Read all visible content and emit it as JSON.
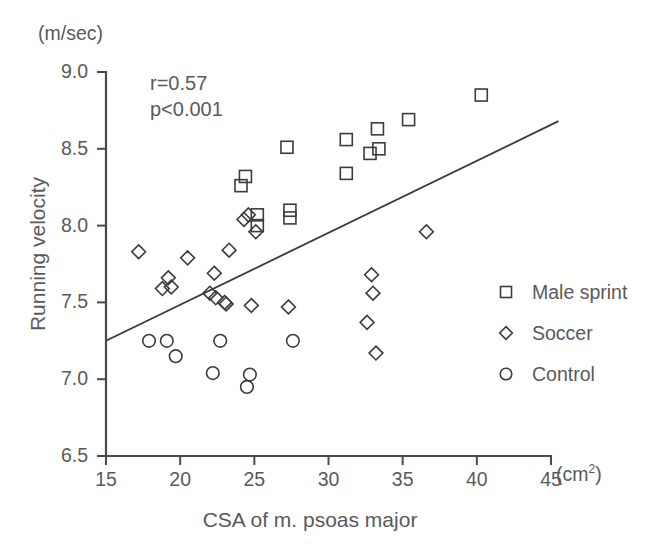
{
  "chart_data": {
    "type": "scatter",
    "title": "",
    "xlabel": "CSA of m. psoas major",
    "ylabel": "Running velocity",
    "x_unit": "(cm",
    "x_unit_sup": "2",
    "x_unit_close": ")",
    "y_unit": "(m/sec)",
    "xlim": [
      15,
      45
    ],
    "ylim": [
      6.5,
      9.0
    ],
    "xticks": [
      15,
      20,
      25,
      30,
      35,
      40,
      45
    ],
    "xtick_labels": [
      "15",
      "20",
      "25",
      "30",
      "35",
      "40",
      "45"
    ],
    "yticks": [
      6.5,
      7.0,
      7.5,
      8.0,
      8.5,
      9.0
    ],
    "ytick_labels": [
      "6.5",
      "7.0",
      "7.5",
      "8.0",
      "8.5",
      "9.0"
    ],
    "grid": false,
    "legend_position": "right-middle",
    "annotations": [
      {
        "name": "correlation",
        "text": "r=0.57"
      },
      {
        "name": "p-value",
        "text": "p<0.001"
      }
    ],
    "regression_line": {
      "x": [
        15.0,
        45.5
      ],
      "y": [
        7.25,
        8.68
      ],
      "color": "#3a3a3a"
    },
    "series": [
      {
        "name": "Male sprint",
        "marker": "square",
        "color": "#3c3c3c",
        "points": [
          [
            25.2,
            8.07
          ],
          [
            25.2,
            8.0
          ],
          [
            27.4,
            8.05
          ],
          [
            27.4,
            8.1
          ],
          [
            24.4,
            8.32
          ],
          [
            24.1,
            8.26
          ],
          [
            27.2,
            8.51
          ],
          [
            31.2,
            8.34
          ],
          [
            31.2,
            8.56
          ],
          [
            32.8,
            8.47
          ],
          [
            33.3,
            8.63
          ],
          [
            33.4,
            8.5
          ],
          [
            35.4,
            8.69
          ],
          [
            40.3,
            8.85
          ]
        ]
      },
      {
        "name": "Soccer",
        "marker": "diamond",
        "color": "#3c3c3c",
        "points": [
          [
            17.2,
            7.83
          ],
          [
            20.5,
            7.79
          ],
          [
            19.2,
            7.66
          ],
          [
            19.4,
            7.6
          ],
          [
            18.8,
            7.59
          ],
          [
            22.3,
            7.69
          ],
          [
            22.0,
            7.56
          ],
          [
            22.4,
            7.53
          ],
          [
            23.0,
            7.5
          ],
          [
            23.1,
            7.49
          ],
          [
            24.8,
            7.48
          ],
          [
            23.3,
            7.84
          ],
          [
            24.3,
            8.04
          ],
          [
            24.6,
            8.07
          ],
          [
            25.1,
            7.96
          ],
          [
            27.3,
            7.47
          ],
          [
            32.6,
            7.37
          ],
          [
            32.9,
            7.68
          ],
          [
            33.0,
            7.56
          ],
          [
            33.2,
            7.17
          ],
          [
            36.6,
            7.96
          ]
        ]
      },
      {
        "name": "Control",
        "marker": "circle",
        "color": "#3c3c3c",
        "points": [
          [
            17.9,
            7.25
          ],
          [
            19.1,
            7.25
          ],
          [
            19.7,
            7.15
          ],
          [
            22.7,
            7.25
          ],
          [
            22.2,
            7.04
          ],
          [
            24.7,
            7.03
          ],
          [
            24.5,
            6.95
          ],
          [
            27.6,
            7.25
          ]
        ]
      }
    ]
  },
  "legend": {
    "items": [
      {
        "label": "Male sprint",
        "marker": "square"
      },
      {
        "label": "Soccer",
        "marker": "diamond"
      },
      {
        "label": "Control",
        "marker": "circle"
      }
    ]
  }
}
